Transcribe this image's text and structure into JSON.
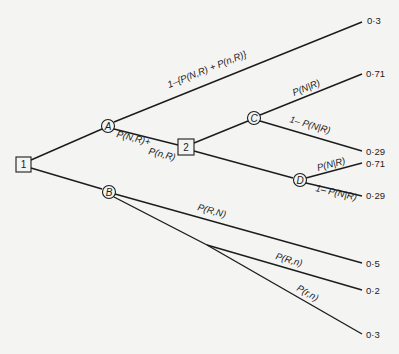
{
  "diagram": {
    "type": "decision-tree",
    "nodes": {
      "n1": {
        "label": "1",
        "shape": "square",
        "x": 23,
        "y": 164
      },
      "n2": {
        "label": "2",
        "shape": "square",
        "x": 186,
        "y": 147
      },
      "A": {
        "label": "A",
        "shape": "circle",
        "x": 108,
        "y": 126
      },
      "B": {
        "label": "B",
        "shape": "circle",
        "x": 109,
        "y": 192
      },
      "C": {
        "label": "C",
        "shape": "circle",
        "x": 254,
        "y": 118
      },
      "D": {
        "label": "D",
        "shape": "circle",
        "x": 300,
        "y": 180
      }
    },
    "edge_labels": {
      "a_top": "1–{P(N,R) + P(n,R)}",
      "a_to_2_line1": "P(N,R)+",
      "a_to_2_line2": "P(n,R)",
      "c_top": "P(N|R)",
      "c_bottom": "1– P(N|R)",
      "d_top": "P(N|R)",
      "d_bottom": "1– P(N|R)",
      "b_top": "P(R,N)",
      "b_mid": "P(R,n)",
      "b_bottom": "P(r,n)"
    },
    "outcomes": {
      "a_top": "0·3",
      "c_top": "0·71",
      "c_bottom": "0·29",
      "d_top": "0·71",
      "d_bottom": "0·29",
      "b_top": "0·5",
      "b_mid": "0·2",
      "b_bottom": "0·3"
    }
  }
}
